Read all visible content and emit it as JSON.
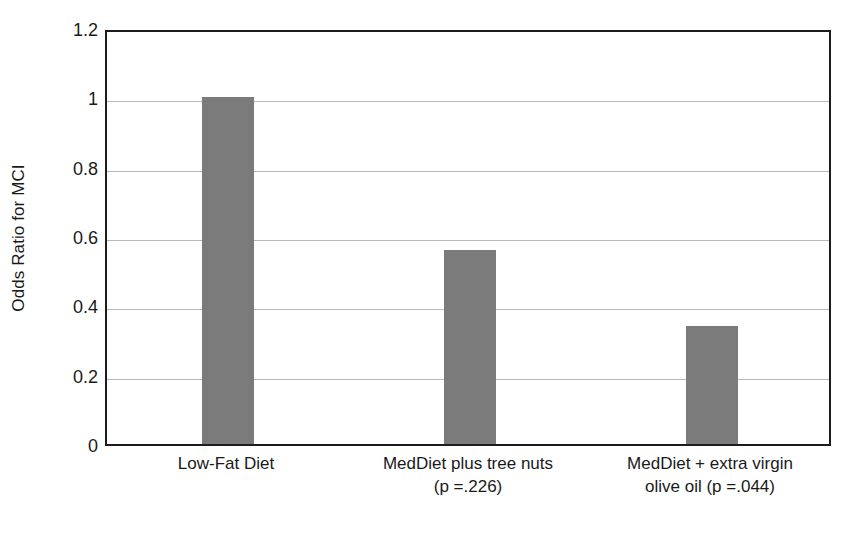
{
  "chart_data": {
    "type": "bar",
    "title": "",
    "subtitle": "",
    "xlabel": "",
    "ylabel": "Odds Ratio for MCI",
    "categories": [
      "Low-Fat Diet",
      "MedDiet plus tree nuts\n(p =.226)",
      "MedDiet + extra virgin\nolive oil (p =.044)"
    ],
    "values": [
      1.0,
      0.56,
      0.34
    ],
    "ylim": [
      0,
      1.2
    ],
    "yticks": [
      0,
      0.2,
      0.4,
      0.6,
      0.8,
      1,
      1.2
    ],
    "ytick_labels": [
      "0",
      "0.2",
      "0.4",
      "0.6",
      "0.8",
      "1",
      "1.2"
    ],
    "grid": true,
    "legend": "none",
    "annotations": [
      {
        "category": "MedDiet plus tree nuts",
        "p_value": "p =.226"
      },
      {
        "category": "MedDiet + extra virgin olive oil",
        "p_value": "p =.044"
      }
    ],
    "colors": {
      "bar_fill": "#7b7b7b",
      "axis": "#1c1c1c",
      "gridline": "#b9b9b9",
      "background": "#ffffff",
      "text": "#1a1a1a"
    }
  }
}
